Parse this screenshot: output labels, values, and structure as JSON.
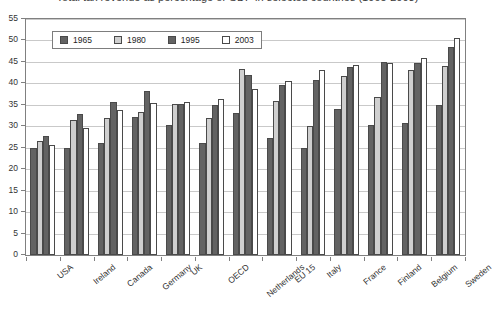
{
  "chart_data": {
    "type": "bar",
    "title": "Total tax revenue as percentage of GDP in selected countries (1965-2003)",
    "xlabel": "",
    "ylabel": "",
    "ylim": [
      0,
      55
    ],
    "ytick_step": 5,
    "yticks": [
      0,
      5,
      10,
      15,
      20,
      25,
      30,
      35,
      40,
      45,
      50,
      55
    ],
    "grid": true,
    "legend_position": "top-left inside plot",
    "categories": [
      "USA",
      "Ireland",
      "Canada",
      "Germany",
      "UK",
      "OECD",
      "Netherlands",
      "EU 15",
      "Italy",
      "France",
      "Finland",
      "Belgium",
      "Sweden"
    ],
    "series": [
      {
        "name": "1965",
        "color": "#636363",
        "values": [
          25.0,
          25.0,
          26.2,
          32.1,
          30.2,
          26.2,
          33.1,
          27.2,
          25.0,
          34.1,
          30.2,
          30.8,
          35.0
        ]
      },
      {
        "name": "1980",
        "color": "#cfcfcf",
        "values": [
          26.5,
          31.5,
          32.0,
          33.3,
          35.3,
          32.0,
          43.4,
          36.0,
          30.0,
          41.7,
          36.8,
          43.1,
          44.0
        ]
      },
      {
        "name": "1995",
        "color": "#636363",
        "values": [
          27.7,
          32.8,
          35.6,
          38.2,
          35.2,
          34.9,
          41.9,
          39.7,
          40.8,
          43.9,
          45.0,
          44.8,
          48.5
        ]
      },
      {
        "name": "2003",
        "color": "#ffffff",
        "values": [
          25.6,
          29.7,
          33.8,
          35.5,
          35.6,
          36.3,
          38.8,
          40.5,
          43.1,
          44.2,
          44.8,
          45.8,
          50.6
        ]
      }
    ]
  },
  "legend": {
    "entries": [
      {
        "label": "1965"
      },
      {
        "label": "1980"
      },
      {
        "label": "1995"
      },
      {
        "label": "2003"
      }
    ]
  }
}
